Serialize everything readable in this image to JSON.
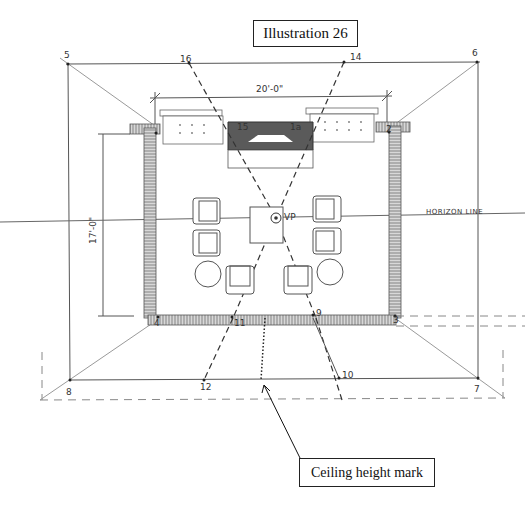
{
  "title": "Illustration 26",
  "callout": {
    "label": "Ceiling height mark"
  },
  "annotations": {
    "width_dimension": "20'-0\"",
    "depth_dimension": "17'-0\"",
    "horizon_line": "HORIZON LINE",
    "vanishing_point": "VP"
  },
  "points": [
    {
      "id": "p2",
      "label": "2"
    },
    {
      "id": "p3",
      "label": "3"
    },
    {
      "id": "p4",
      "label": "4"
    },
    {
      "id": "p5",
      "label": "5"
    },
    {
      "id": "p6",
      "label": "6"
    },
    {
      "id": "p7",
      "label": "7"
    },
    {
      "id": "p8",
      "label": "8"
    },
    {
      "id": "p9",
      "label": "9"
    },
    {
      "id": "p10",
      "label": "10"
    },
    {
      "id": "p11",
      "label": "11"
    },
    {
      "id": "p12",
      "label": "12"
    },
    {
      "id": "p14",
      "label": "14"
    },
    {
      "id": "p15",
      "label": "15"
    },
    {
      "id": "p16",
      "label": "16"
    },
    {
      "id": "p1a",
      "label": "1a"
    }
  ],
  "colors": {
    "ink": "#333333",
    "fireplace_fill": "#5a5a5a",
    "wall_hatch": "#8a8a8a"
  }
}
